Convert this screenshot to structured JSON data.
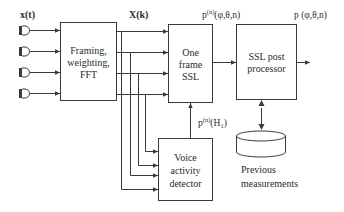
{
  "diagram": {
    "inputs": {
      "label": "x(t)",
      "mic_count": 4
    },
    "spectrum_label": "X(k)",
    "blocks": {
      "framing": {
        "lines": [
          "Framing,",
          "weighting,",
          "FFT"
        ]
      },
      "one_frame_ssl": {
        "lines": [
          "One",
          "frame",
          "SSL"
        ]
      },
      "ssl_post": {
        "lines": [
          "SSL post",
          "processor"
        ]
      },
      "vad": {
        "lines": [
          "Voice",
          "activity",
          "detector"
        ]
      },
      "storage": {
        "lines": [
          "Previous",
          "measurements"
        ]
      }
    },
    "signals": {
      "frame_output_base": "p",
      "frame_output_sup": "(n)",
      "frame_output_args": "(φ,θ,n)",
      "final_output": "p (φ,θ,n)",
      "vad_output_base": "p",
      "vad_output_sup": "(n)",
      "vad_output_args": "(H",
      "vad_output_sub": "1",
      "vad_output_close": ")"
    }
  }
}
